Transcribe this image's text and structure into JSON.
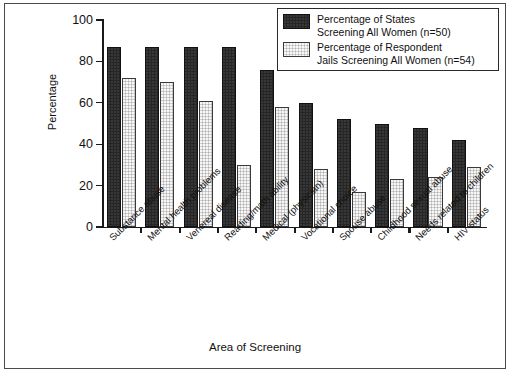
{
  "chart_data": {
    "type": "bar",
    "title": "",
    "xlabel": "Area of Screening",
    "ylabel": "Percentage",
    "ylim": [
      0,
      100
    ],
    "yticks": [
      0,
      20,
      40,
      60,
      80,
      100
    ],
    "grid": false,
    "legend_position": "top-right",
    "categories": [
      "Substance abuse",
      "Mental health problems",
      "Venereal disease",
      "Reading/math ability",
      "Medical (physician)",
      "Vocational choice",
      "Spouse abuse",
      "Childhood sexual abuse",
      "Needs related to children",
      "HIV status"
    ],
    "series": [
      {
        "name": "Percentage of States Screening All Women (n=50)",
        "legend_line1": "Percentage of States",
        "legend_line2": "Screening All Women (n=50)",
        "color": "#262626",
        "values": [
          87,
          87,
          87,
          87,
          76,
          60,
          52,
          50,
          48,
          42
        ]
      },
      {
        "name": "Percentage of Respondent Jails Screening All Women (n=54)",
        "legend_line1": "Percentage of Respondent",
        "legend_line2": "Jails Screening All Women (n=54)",
        "color": "#d4d4d4",
        "values": [
          72,
          70,
          61,
          30,
          58,
          28,
          17,
          23,
          24,
          29
        ]
      }
    ]
  },
  "figure": {
    "border_color": "#4a4a4a",
    "background": "#ffffff"
  }
}
